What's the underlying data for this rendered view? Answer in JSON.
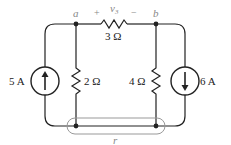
{
  "circuit": {
    "nodes": {
      "a": "a",
      "b": "b",
      "r": "r"
    },
    "voltage_label": {
      "plus": "+",
      "name": "v",
      "subscript": "3",
      "minus": "−"
    },
    "components": {
      "r3": {
        "value": "3 Ω"
      },
      "r2": {
        "value": "2 Ω"
      },
      "r4": {
        "value": "4 Ω"
      },
      "source_left": {
        "value": "5 A",
        "direction": "up"
      },
      "source_right": {
        "value": "6 A",
        "direction": "down"
      }
    },
    "colors": {
      "wire": "#222222",
      "highlight": "#999999",
      "label_muted": "#888888"
    }
  }
}
